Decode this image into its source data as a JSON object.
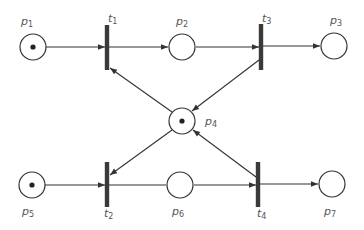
{
  "diagram": {
    "type": "petri-net",
    "colors": {
      "stroke": "#333333",
      "bar": "#3a3a3a",
      "label": "#555555",
      "background": "#ffffff"
    },
    "places": [
      {
        "id": "p1",
        "label": "p",
        "sub": "1",
        "cx": 33,
        "cy": 47,
        "tokens": 1,
        "lx": 21,
        "ly": 25
      },
      {
        "id": "p2",
        "label": "p",
        "sub": "2",
        "cx": 182,
        "cy": 47,
        "tokens": 0,
        "lx": 176,
        "ly": 25
      },
      {
        "id": "p3",
        "label": "p",
        "sub": "3",
        "cx": 334,
        "cy": 46,
        "tokens": 0,
        "lx": 330,
        "ly": 24
      },
      {
        "id": "p4",
        "label": "p",
        "sub": "4",
        "cx": 182,
        "cy": 121,
        "tokens": 1,
        "lx": 205,
        "ly": 125
      },
      {
        "id": "p5",
        "label": "p",
        "sub": "5",
        "cx": 32,
        "cy": 185,
        "tokens": 1,
        "lx": 22,
        "ly": 215
      },
      {
        "id": "p6",
        "label": "p",
        "sub": "6",
        "cx": 180,
        "cy": 185,
        "tokens": 0,
        "lx": 172,
        "ly": 215
      },
      {
        "id": "p7",
        "label": "p",
        "sub": "7",
        "cx": 332,
        "cy": 184,
        "tokens": 0,
        "lx": 324,
        "ly": 215
      }
    ],
    "transitions": [
      {
        "id": "t1",
        "label": "t",
        "sub": "1",
        "x": 107,
        "y1": 25,
        "y2": 70,
        "lx": 108,
        "ly": 22
      },
      {
        "id": "t3",
        "label": "t",
        "sub": "3",
        "x": 261,
        "y1": 24,
        "y2": 70,
        "lx": 262,
        "ly": 22
      },
      {
        "id": "t2",
        "label": "t",
        "sub": "2",
        "x": 107,
        "y1": 162,
        "y2": 207,
        "lx": 104,
        "ly": 217
      },
      {
        "id": "t4",
        "label": "t",
        "sub": "4",
        "x": 258,
        "y1": 162,
        "y2": 207,
        "lx": 257,
        "ly": 217
      }
    ],
    "arcs": [
      {
        "from": "p1",
        "to": "t1",
        "x1": 46,
        "y1": 47,
        "x2": 105,
        "y2": 47
      },
      {
        "from": "t1",
        "to": "p2",
        "x1": 109,
        "y1": 47,
        "x2": 168,
        "y2": 47
      },
      {
        "from": "p2",
        "to": "t3",
        "x1": 196,
        "y1": 47,
        "x2": 259,
        "y2": 47
      },
      {
        "from": "t3",
        "to": "p3",
        "x1": 263,
        "y1": 46,
        "x2": 320,
        "y2": 46
      },
      {
        "from": "p4",
        "to": "t1",
        "x1": 172,
        "y1": 112,
        "x2": 110,
        "y2": 68
      },
      {
        "from": "t3",
        "to": "p4",
        "x1": 259,
        "y1": 60,
        "x2": 192,
        "y2": 111
      },
      {
        "from": "p4",
        "to": "t2",
        "x1": 172,
        "y1": 130,
        "x2": 110,
        "y2": 175
      },
      {
        "from": "t4",
        "to": "p4",
        "x1": 256,
        "y1": 177,
        "x2": 193,
        "y2": 130
      },
      {
        "from": "p5",
        "to": "t2",
        "x1": 45,
        "y1": 185,
        "x2": 105,
        "y2": 185
      },
      {
        "from": "t2",
        "to": "p6",
        "x1": 109,
        "y1": 185,
        "x2": 166,
        "y2": 185,
        "arrow": false
      },
      {
        "from": "p6",
        "to": "t4",
        "x1": 194,
        "y1": 185,
        "x2": 256,
        "y2": 185
      },
      {
        "from": "t4",
        "to": "p7",
        "x1": 260,
        "y1": 184,
        "x2": 318,
        "y2": 184
      }
    ]
  }
}
